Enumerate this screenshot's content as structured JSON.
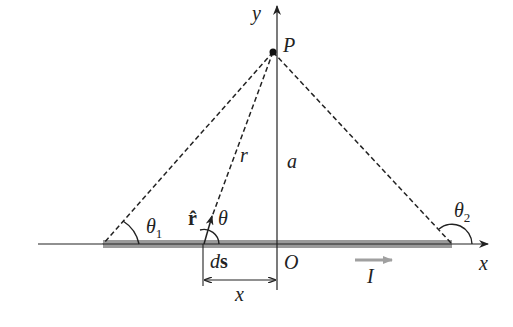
{
  "diagram": {
    "labels": {
      "y_axis": "y",
      "x_axis": "x",
      "point": "P",
      "origin": "O",
      "distance_r": "r",
      "distance_a": "a",
      "theta1": "θ",
      "theta1_sub": "1",
      "theta2": "θ",
      "theta2_sub": "2",
      "theta": "θ",
      "r_hat": "r̂",
      "ds_d": "d",
      "ds_s": "s",
      "x_dim": "x",
      "current": "I"
    },
    "colors": {
      "wire": "#9a9a9a",
      "lines": "#222222",
      "current_arrow": "#a0a0a0"
    }
  }
}
